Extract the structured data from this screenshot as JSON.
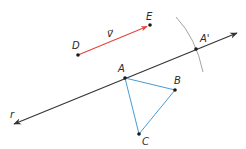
{
  "diagram": {
    "colors": {
      "line": "#333333",
      "vector": "#e0463a",
      "triangle": "#4a9ad4",
      "arc": "#8a8a8a",
      "point": "#1a1a1a"
    },
    "points": {
      "D": {
        "label": "D",
        "x": 78,
        "y": 55
      },
      "E": {
        "label": "E",
        "x": 150,
        "y": 25
      },
      "A": {
        "label": "A",
        "x": 125,
        "y": 78
      },
      "A_prime": {
        "label": "A'",
        "x": 196,
        "y": 49
      },
      "B": {
        "label": "B",
        "x": 175,
        "y": 90
      },
      "C": {
        "label": "C",
        "x": 139,
        "y": 134
      }
    },
    "vector_label": "v⃗",
    "line_label": "r"
  }
}
